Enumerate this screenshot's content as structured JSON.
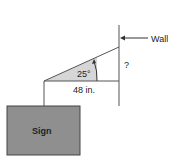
{
  "diagram": {
    "wall_label": "Wall",
    "unknown_label": "?",
    "angle_label": "25°",
    "length_label": "48 in.",
    "sign_label": "Sign",
    "colors": {
      "line": "#555555",
      "wedge_fill": "#d6d6d6",
      "sign_fill": "#8f8f8f",
      "sign_border": "#444444",
      "text": "#222222"
    }
  }
}
